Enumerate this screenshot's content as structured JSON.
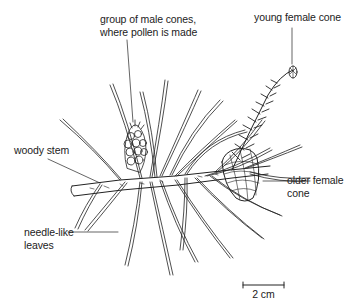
{
  "diagram": {
    "labels": {
      "male_cones_line1": "group of male cones,",
      "male_cones_line2": "where pollen is made",
      "young_female_cone": "young female cone",
      "woody_stem": "woody stem",
      "older_female_cone_line1": "older female",
      "older_female_cone_line2": "cone",
      "needle_leaves_line1": "needle-like",
      "needle_leaves_line2": "leaves"
    },
    "scale_bar": {
      "label": "2 cm"
    },
    "colors": {
      "ink": "#222222",
      "background": "#ffffff"
    }
  }
}
